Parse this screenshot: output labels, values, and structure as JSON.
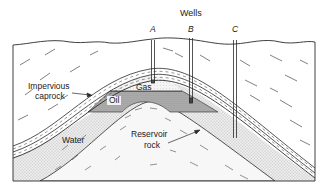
{
  "diagram": {
    "title": "Wells",
    "wells": [
      {
        "label": "A",
        "x": 153,
        "bottom": 83
      },
      {
        "label": "B",
        "x": 191,
        "bottom": 103
      },
      {
        "label": "C",
        "x": 235,
        "bottom": 138
      }
    ],
    "labels": {
      "gas": "Gas",
      "oil": "Oil",
      "water": "Water",
      "caprock_line1": "Impervious",
      "caprock_line2": "caprock",
      "reservoir_line1": "Reservoir",
      "reservoir_line2": "rock"
    },
    "colors": {
      "line": "#2a2a2a",
      "oil_fill": "#a9a9a9",
      "gas_fill": "#e6e6e6",
      "water_fill": "#dedede",
      "background": "#ffffff"
    }
  }
}
